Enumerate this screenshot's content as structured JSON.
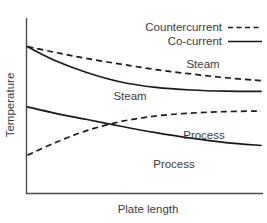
{
  "chart_data": {
    "type": "line",
    "title": "",
    "xlabel": "Plate length",
    "ylabel": "Temperature",
    "grid": false,
    "axis_ticks": false,
    "xlim": [
      0,
      1
    ],
    "ylim": [
      0,
      1
    ],
    "legend": {
      "position": "top-right",
      "entries": [
        {
          "name": "Countercurrent",
          "style": "dashed"
        },
        {
          "name": "Co-current",
          "style": "solid"
        }
      ]
    },
    "series": [
      {
        "name": "Steam (countercurrent)",
        "label": "Steam",
        "style": "dashed",
        "x": [
          0.0,
          0.12,
          0.25,
          0.4,
          0.55,
          0.7,
          0.85,
          1.0
        ],
        "y": [
          0.975,
          0.935,
          0.895,
          0.855,
          0.818,
          0.788,
          0.762,
          0.742
        ]
      },
      {
        "name": "Steam (co-current)",
        "label": "Steam",
        "style": "solid",
        "x": [
          0.0,
          0.12,
          0.25,
          0.4,
          0.55,
          0.7,
          0.85,
          1.0
        ],
        "y": [
          0.975,
          0.878,
          0.8,
          0.733,
          0.696,
          0.678,
          0.67,
          0.668
        ]
      },
      {
        "name": "Process (countercurrent)",
        "label": "Process",
        "style": "dashed",
        "x": [
          0.0,
          0.12,
          0.25,
          0.4,
          0.55,
          0.7,
          0.85,
          1.0
        ],
        "y": [
          0.232,
          0.318,
          0.398,
          0.462,
          0.5,
          0.52,
          0.53,
          0.534
        ]
      },
      {
        "name": "Process (co-current)",
        "label": "Process",
        "style": "solid",
        "x": [
          0.0,
          0.12,
          0.25,
          0.4,
          0.55,
          0.7,
          0.85,
          1.0
        ],
        "y": [
          0.562,
          0.518,
          0.478,
          0.43,
          0.386,
          0.348,
          0.318,
          0.298
        ]
      }
    ],
    "curve_labels": [
      {
        "text": "Steam",
        "series": "Steam (countercurrent)"
      },
      {
        "text": "Steam",
        "series": "Steam (co-current)"
      },
      {
        "text": "Process",
        "series": "Process (countercurrent)"
      },
      {
        "text": "Process",
        "series": "Process (co-current)"
      }
    ],
    "colors": {
      "line": "#1a1a1a",
      "axis": "#4a4a4a",
      "text": "#3d3d3d",
      "background": "#ffffff"
    }
  }
}
